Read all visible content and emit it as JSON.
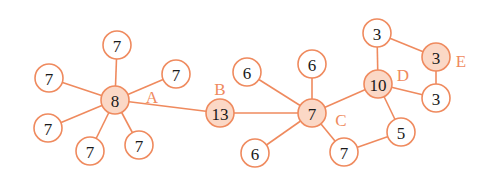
{
  "colors": {
    "edge": "#ef8a5e",
    "node_stroke": "#ef8a5e",
    "node_fill": "#ffffff",
    "hub_fill": "#fbd8c6",
    "label": "#ef8a5e",
    "text": "#1a1a1a"
  },
  "nodes": [
    {
      "id": "a_top",
      "value": "7",
      "x": 117,
      "y": 45,
      "hub": false
    },
    {
      "id": "a_ul",
      "value": "7",
      "x": 49,
      "y": 78,
      "hub": false
    },
    {
      "id": "a_ur",
      "value": "7",
      "x": 176,
      "y": 74,
      "hub": false
    },
    {
      "id": "A",
      "value": "8",
      "x": 115,
      "y": 100,
      "hub": true,
      "label": "A",
      "lx": 152,
      "ly": 97
    },
    {
      "id": "a_ll",
      "value": "7",
      "x": 48,
      "y": 128,
      "hub": false
    },
    {
      "id": "a_bl",
      "value": "7",
      "x": 90,
      "y": 151,
      "hub": false
    },
    {
      "id": "a_br",
      "value": "7",
      "x": 139,
      "y": 145,
      "hub": false
    },
    {
      "id": "B",
      "value": "13",
      "x": 220,
      "y": 113,
      "hub": true,
      "label": "B",
      "lx": 220,
      "ly": 89
    },
    {
      "id": "c_tl",
      "value": "6",
      "x": 247,
      "y": 72,
      "hub": false
    },
    {
      "id": "c_t",
      "value": "6",
      "x": 312,
      "y": 64,
      "hub": false
    },
    {
      "id": "C",
      "value": "7",
      "x": 312,
      "y": 113,
      "hub": true,
      "label": "C",
      "lx": 341,
      "ly": 120
    },
    {
      "id": "c_bl",
      "value": "6",
      "x": 255,
      "y": 153,
      "hub": false
    },
    {
      "id": "c_br",
      "value": "7",
      "x": 344,
      "y": 152,
      "hub": false
    },
    {
      "id": "D",
      "value": "10",
      "x": 378,
      "y": 84,
      "hub": true,
      "label": "D",
      "lx": 403,
      "ly": 75
    },
    {
      "id": "d_t",
      "value": "3",
      "x": 377,
      "y": 33,
      "hub": false
    },
    {
      "id": "E",
      "value": "3",
      "x": 436,
      "y": 57,
      "hub": true,
      "label": "E",
      "lx": 461,
      "ly": 61
    },
    {
      "id": "d_r",
      "value": "3",
      "x": 436,
      "y": 98,
      "hub": false
    },
    {
      "id": "d_b",
      "value": "5",
      "x": 401,
      "y": 132,
      "hub": false
    }
  ],
  "edges": [
    [
      "A",
      "a_top"
    ],
    [
      "A",
      "a_ul"
    ],
    [
      "A",
      "a_ur"
    ],
    [
      "A",
      "a_ll"
    ],
    [
      "A",
      "a_bl"
    ],
    [
      "A",
      "a_br"
    ],
    [
      "A",
      "B"
    ],
    [
      "B",
      "C"
    ],
    [
      "C",
      "c_tl"
    ],
    [
      "C",
      "c_t"
    ],
    [
      "C",
      "c_bl"
    ],
    [
      "C",
      "c_br"
    ],
    [
      "C",
      "D"
    ],
    [
      "c_br",
      "d_b"
    ],
    [
      "D",
      "d_b"
    ],
    [
      "D",
      "d_t"
    ],
    [
      "D",
      "d_r"
    ],
    [
      "d_t",
      "E"
    ],
    [
      "E",
      "d_r"
    ]
  ],
  "node_radius": 14
}
